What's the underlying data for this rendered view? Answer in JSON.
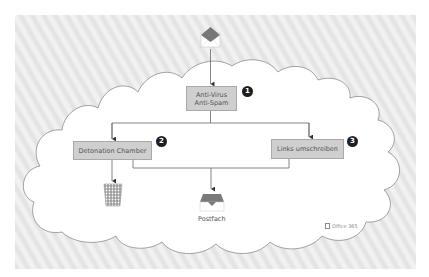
{
  "diagram": {
    "nodes": {
      "sender": {
        "icon": "envelope-icon"
      },
      "antivirus": {
        "line1": "Anti-Virus",
        "line2": "Anti-Spam",
        "badge": "1"
      },
      "detonation": {
        "label": "Detonation Chamber",
        "badge": "2"
      },
      "links": {
        "label": "Links umschreiben",
        "badge": "3"
      },
      "trash": {
        "icon": "trash-icon"
      },
      "mailbox": {
        "icon": "inbox-icon",
        "label": "Postfach"
      }
    },
    "brand": {
      "label": "Office 365",
      "icon": "office-icon"
    },
    "colors": {
      "box_fill": "#cfcfcf",
      "box_border": "#a9a9a9",
      "badge": "#1f1f1f",
      "envelope_top": "#777777",
      "background_hatch": "#ebebeb",
      "cloud_fill": "#ffffff",
      "lines": "#666666"
    },
    "edges": [
      {
        "from": "sender",
        "to": "antivirus"
      },
      {
        "from": "antivirus",
        "to": "detonation"
      },
      {
        "from": "antivirus",
        "to": "links"
      },
      {
        "from": "detonation",
        "to": "trash"
      },
      {
        "from": "detonation",
        "to": "mailbox"
      },
      {
        "from": "links",
        "to": "mailbox"
      }
    ]
  }
}
